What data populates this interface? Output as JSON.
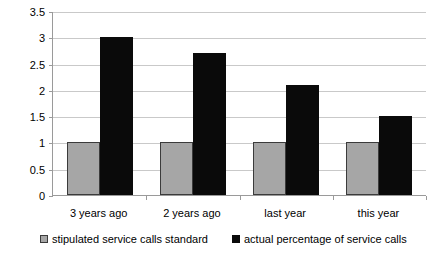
{
  "chart_data": {
    "type": "bar",
    "title": "",
    "subtitle": "",
    "xlabel": "",
    "ylabel": "",
    "categories": [
      "3 years ago",
      "2 years ago",
      "last year",
      "this year"
    ],
    "series": [
      {
        "name": "stipulated service calls standard",
        "color": "#a6a6a6",
        "values": [
          1,
          1,
          1,
          1
        ]
      },
      {
        "name": "actual percentage of service calls",
        "color": "#0a0a0a",
        "values": [
          3,
          2.7,
          2.1,
          1.5
        ]
      }
    ],
    "ylim": [
      0,
      3.5
    ],
    "ytick_values": [
      0,
      0.5,
      1,
      1.5,
      2,
      2.5,
      3,
      3.5
    ],
    "ytick_labels": [
      "0",
      "0.5",
      "1",
      "1.5",
      "2",
      "2.5",
      "3",
      "3.5"
    ],
    "grid": true,
    "grid_axis": "y",
    "grid_color": "#c9c9c9",
    "legend_position": "bottom",
    "axis_color": "#9a9a9a",
    "background": "#ffffff"
  },
  "legend": {
    "entries": [
      {
        "label": "stipulated service calls standard",
        "swatch": "gray-swatch"
      },
      {
        "label": "actual percentage of service calls",
        "swatch": "black-swatch"
      }
    ]
  }
}
